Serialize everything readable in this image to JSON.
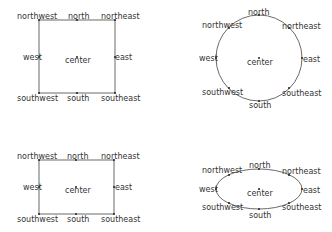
{
  "diagrams": [
    {
      "id": "rect-top",
      "shape": "rectangle",
      "labels": {
        "northwest": "northwest",
        "north": "north",
        "northeast": "northeast",
        "west": "west",
        "center": "center",
        "east": "east",
        "southwest": "southwest",
        "south": "south",
        "southeast": "southeast"
      }
    },
    {
      "id": "circle-top",
      "shape": "circle",
      "labels": {
        "northwest": "northwest",
        "north": "north",
        "northeast": "northeast",
        "west": "west",
        "center": "center",
        "east": "east",
        "southwest": "southwest",
        "south": "south",
        "southeast": "southeast"
      }
    },
    {
      "id": "rect-bottom",
      "shape": "rectangle",
      "labels": {
        "northwest": "northwest",
        "north": "north",
        "northeast": "northeast",
        "west": "west",
        "center": "center",
        "east": "east",
        "southwest": "southwest",
        "south": "south",
        "southeast": "southeast"
      }
    },
    {
      "id": "ellipse-bottom",
      "shape": "ellipse",
      "labels": {
        "northwest": "northwest",
        "north": "north",
        "northeast": "northeast",
        "west": "west",
        "center": "center",
        "east": "east",
        "southwest": "southwest",
        "south": "south",
        "southeast": "southeast"
      }
    }
  ],
  "colors": {
    "stroke": "#444444",
    "text": "#333333",
    "background": "#ffffff"
  }
}
